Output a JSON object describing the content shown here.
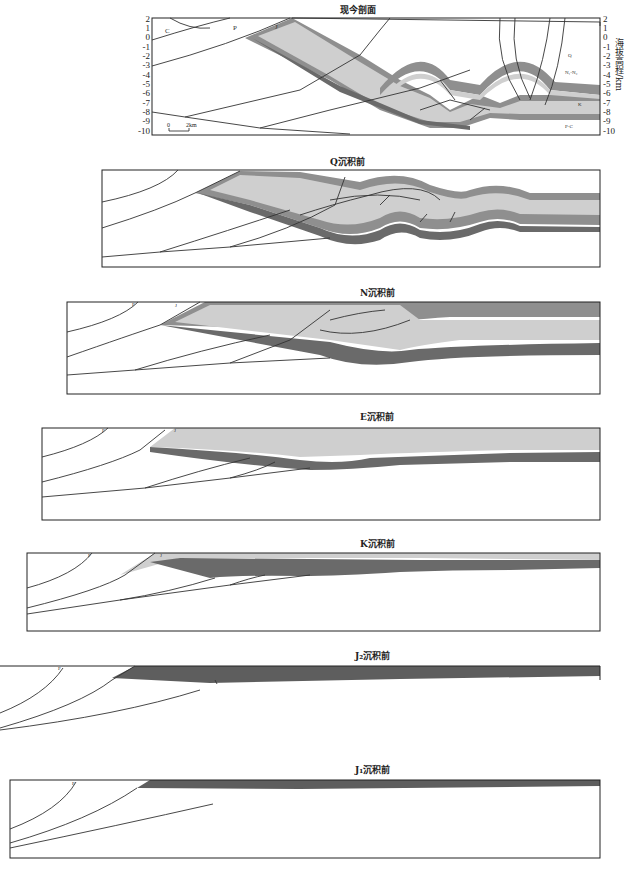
{
  "figure": {
    "panels": [
      {
        "id": "present",
        "title": "现今剖面"
      },
      {
        "id": "pre_q",
        "title": "Q沉积前"
      },
      {
        "id": "pre_n",
        "title": "N沉积前"
      },
      {
        "id": "pre_e",
        "title": "E沉积前"
      },
      {
        "id": "pre_k",
        "title": "K沉积前"
      },
      {
        "id": "pre_j2",
        "title": "J₂沉积前"
      },
      {
        "id": "pre_j1",
        "title": "J₁沉积前"
      }
    ],
    "present_axis": {
      "ylabel": "海拔高程/km",
      "ticks": [
        "2",
        "1",
        "0",
        "-1",
        "-2",
        "-3",
        "-4",
        "-5",
        "-6",
        "-7",
        "-8",
        "-9",
        "-10"
      ]
    },
    "scale_bar": {
      "start": "0",
      "end": "2km"
    },
    "strata_labels": {
      "C": "C",
      "P": "P",
      "J": "J",
      "Q": "Q",
      "N": "N₁-N₂",
      "E": "E",
      "K": "K",
      "PC": "P-C"
    },
    "colors": {
      "light_fill": "#cfcfcf",
      "mid_fill": "#9a9a9a",
      "dark_fill": "#6a6a6a",
      "line": "#333333"
    }
  }
}
